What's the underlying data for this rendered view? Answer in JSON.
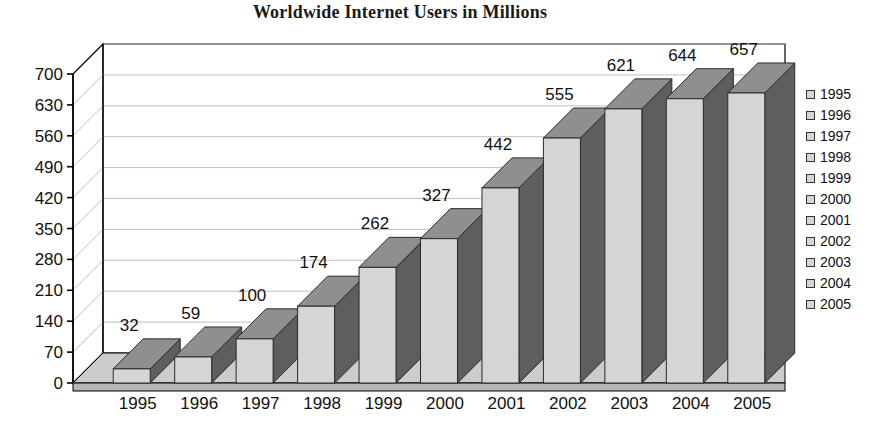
{
  "chart_data": {
    "type": "bar",
    "title": "Worldwide Internet Users in Millions",
    "xlabel": "",
    "ylabel": "",
    "categories": [
      "1995",
      "1996",
      "1997",
      "1998",
      "1999",
      "2000",
      "2001",
      "2002",
      "2003",
      "2004",
      "2005"
    ],
    "values": [
      32,
      59,
      100,
      174,
      262,
      327,
      442,
      555,
      621,
      644,
      657
    ],
    "data_labels": [
      "32",
      "59",
      "100",
      "174",
      "262",
      "327",
      "442",
      "555",
      "621",
      "644",
      "657"
    ],
    "ylim": [
      0,
      700
    ],
    "yticks": [
      0,
      70,
      140,
      210,
      280,
      350,
      420,
      490,
      560,
      630,
      700
    ],
    "ytick_labels": [
      "0",
      "70",
      "140",
      "210",
      "280",
      "350",
      "420",
      "490",
      "560",
      "630",
      "700"
    ],
    "xtick_labels": [
      "1995",
      "1996",
      "1997",
      "1998",
      "1999",
      "2000",
      "2001",
      "2002",
      "2003",
      "2004",
      "2005"
    ],
    "grid": true,
    "three_d": true,
    "legend_position": "right",
    "legend_entries": [
      {
        "label": "1995",
        "color": "#d5d5d5"
      },
      {
        "label": "1996",
        "color": "#d5d5d5"
      },
      {
        "label": "1997",
        "color": "#d5d5d5"
      },
      {
        "label": "1998",
        "color": "#d5d5d5"
      },
      {
        "label": "1999",
        "color": "#d5d5d5"
      },
      {
        "label": "2000",
        "color": "#d5d5d5"
      },
      {
        "label": "2001",
        "color": "#d5d5d5"
      },
      {
        "label": "2002",
        "color": "#d5d5d5"
      },
      {
        "label": "2003",
        "color": "#d5d5d5"
      },
      {
        "label": "2004",
        "color": "#d5d5d5"
      },
      {
        "label": "2005",
        "color": "#d5d5d5"
      }
    ],
    "colors": {
      "bar_front": "#d5d5d5",
      "bar_side": "#5e5e5e",
      "bar_top": "#8f8f8f",
      "floor": "#b5b5b5",
      "floor_top": "#cccccc",
      "back_wall": "#ffffff",
      "gridline": "#b0b0b0",
      "axis": "#000000",
      "text": "#111111",
      "title": "#1a1a1a"
    }
  }
}
